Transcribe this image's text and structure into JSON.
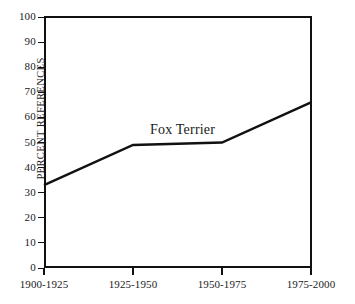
{
  "chart_data": {
    "type": "line",
    "title": "",
    "subtitle": "",
    "xlabel": "",
    "ylabel": "PERCENT REFERENCES",
    "categories": [
      "1900-1925",
      "1925-1950",
      "1950-1975",
      "1975-2000"
    ],
    "series": [
      {
        "name": "Fox Terrier",
        "values": [
          33,
          49,
          50,
          66
        ]
      }
    ],
    "ylim": [
      0,
      100
    ],
    "ytick_step": 10,
    "yticks": [
      0,
      10,
      20,
      30,
      40,
      50,
      60,
      70,
      80,
      90,
      100
    ],
    "ytick_labels": [
      "0",
      "10",
      "20",
      "30",
      "40",
      "50",
      "60",
      "70",
      "80",
      "90",
      "100"
    ],
    "grid": false,
    "legend": "inline-series-label",
    "annotations": [
      {
        "text": "Fox Terrier",
        "near_x": "1925-1950",
        "near_y": 55
      }
    ],
    "line_color": "#111111",
    "background_color": "#ffffff"
  },
  "axes": {
    "y_axis_title": "PERCENT REFERENCES",
    "series_label": "Fox Terrier"
  }
}
